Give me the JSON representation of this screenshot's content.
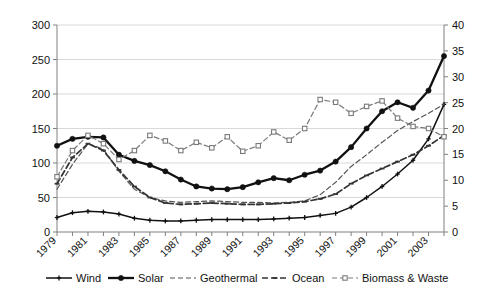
{
  "chart_data": {
    "type": "line",
    "title": "",
    "subtitle": "",
    "xlabel": "",
    "ylabel": "",
    "y2label": "",
    "grid": true,
    "legend_position": "bottom",
    "x": [
      1979,
      1980,
      1981,
      1982,
      1983,
      1984,
      1985,
      1986,
      1987,
      1988,
      1989,
      1990,
      1991,
      1992,
      1993,
      1994,
      1995,
      1996,
      1997,
      1998,
      1999,
      2000,
      2001,
      2002,
      2003,
      2004
    ],
    "xtick_labels": [
      "1979",
      "1981",
      "1983",
      "1985",
      "1987",
      "1989",
      "1991",
      "1993",
      "1995",
      "1997",
      "1999",
      "2001",
      "2003"
    ],
    "xtick_values": [
      1979,
      1981,
      1983,
      1985,
      1987,
      1989,
      1991,
      1993,
      1995,
      1997,
      1999,
      2001,
      2003
    ],
    "ylim": [
      0,
      300
    ],
    "yticks": [
      0,
      50,
      100,
      150,
      200,
      250,
      300
    ],
    "y2lim": [
      0,
      40
    ],
    "y2ticks": [
      0,
      5,
      10,
      15,
      20,
      25,
      30,
      35,
      40
    ],
    "series": [
      {
        "name": "Wind",
        "axis": "left",
        "style": "solid",
        "marker": "plus",
        "color": "#111111",
        "values": [
          21,
          28,
          30,
          29,
          26,
          20,
          17,
          16,
          16,
          17,
          18,
          18,
          18,
          18,
          19,
          20,
          21,
          24,
          27,
          36,
          50,
          66,
          84,
          104,
          135,
          185
        ]
      },
      {
        "name": "Solar",
        "axis": "left",
        "style": "solid",
        "marker": "circle",
        "color": "#111111",
        "values": [
          125,
          135,
          138,
          137,
          112,
          103,
          97,
          88,
          76,
          66,
          63,
          62,
          65,
          72,
          78,
          75,
          83,
          89,
          102,
          123,
          150,
          175,
          188,
          180,
          205,
          255
        ]
      },
      {
        "name": "Geothermal",
        "axis": "left",
        "style": "dashed",
        "marker": "none",
        "color": "#555555",
        "values": [
          62,
          98,
          128,
          120,
          88,
          62,
          50,
          45,
          43,
          44,
          45,
          44,
          43,
          43,
          42,
          43,
          45,
          54,
          72,
          95,
          112,
          130,
          147,
          160,
          172,
          185
        ]
      },
      {
        "name": "Ocean",
        "axis": "left",
        "style": "dashed",
        "marker": "tick",
        "color": "#333333",
        "values": [
          70,
          108,
          128,
          118,
          90,
          66,
          50,
          42,
          40,
          41,
          42,
          41,
          40,
          40,
          41,
          42,
          44,
          48,
          55,
          70,
          82,
          92,
          102,
          112,
          125,
          140
        ]
      },
      {
        "name": "Biomass & Waste",
        "axis": "left",
        "style": "dashed",
        "marker": "square",
        "color": "#7a7a7a",
        "values": [
          80,
          118,
          140,
          128,
          105,
          118,
          140,
          132,
          118,
          130,
          122,
          138,
          117,
          125,
          145,
          133,
          150,
          192,
          188,
          172,
          182,
          190,
          165,
          153,
          150,
          138
        ]
      }
    ],
    "legend": [
      {
        "label": "Wind",
        "style": "solid",
        "marker": "plus"
      },
      {
        "label": "Solar",
        "style": "solid",
        "marker": "circle"
      },
      {
        "label": "Geothermal",
        "style": "dashed",
        "marker": "none"
      },
      {
        "label": "Ocean",
        "style": "dashed",
        "marker": "tick"
      },
      {
        "label": "Biomass & Waste",
        "style": "dashed",
        "marker": "square"
      }
    ],
    "colors": {
      "axis": "#808080",
      "grid": "#cfcfcf",
      "text": "#111111",
      "background": "#ffffff"
    }
  }
}
